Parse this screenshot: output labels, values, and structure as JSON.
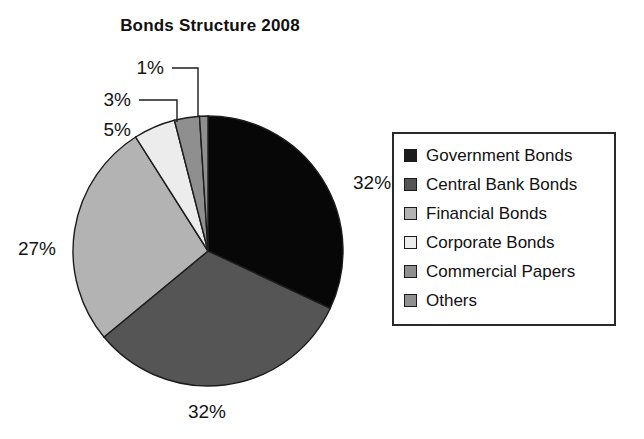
{
  "chart_data": {
    "type": "pie",
    "title": "Bonds Structure 2008",
    "xlabel": "",
    "ylabel": "",
    "legend_position": "right",
    "grid": false,
    "categories": [
      "Government Bonds",
      "Central Bank Bonds",
      "Financial Bonds",
      "Corporate Bonds",
      "Commercial Papers",
      "Others"
    ],
    "values": [
      32,
      32,
      27,
      5,
      3,
      1
    ],
    "value_labels": [
      "32%",
      "32%",
      "27%",
      "5%",
      "3%",
      "1%"
    ],
    "colors": [
      "#070707",
      "#555555",
      "#b3b3b3",
      "#ececec",
      "#8f8f8f",
      "#8f8f8f"
    ],
    "start_angle_deg": 0,
    "direction": "clockwise",
    "slices": [
      {
        "name": "Government Bonds",
        "value": 32,
        "label": "32%",
        "color": "#070707"
      },
      {
        "name": "Central Bank Bonds",
        "value": 32,
        "label": "32%",
        "color": "#555555"
      },
      {
        "name": "Financial Bonds",
        "value": 27,
        "label": "27%",
        "color": "#b3b3b3"
      },
      {
        "name": "Corporate Bonds",
        "value": 5,
        "label": "5%",
        "color": "#ececec"
      },
      {
        "name": "Commercial Papers",
        "value": 3,
        "label": "3%",
        "color": "#8f8f8f"
      },
      {
        "name": "Others",
        "value": 1,
        "label": "1%",
        "color": "#8f8f8f"
      }
    ]
  },
  "legend": {
    "items": [
      {
        "label": "Government Bonds",
        "color": "#1b1b1b"
      },
      {
        "label": "Central Bank Bonds",
        "color": "#555555"
      },
      {
        "label": "Financial Bonds",
        "color": "#b3b3b3"
      },
      {
        "label": "Corporate Bonds",
        "color": "#ececec"
      },
      {
        "label": "Commercial Papers",
        "color": "#8f8f8f"
      },
      {
        "label": "Others",
        "color": "#8f8f8f"
      }
    ]
  }
}
